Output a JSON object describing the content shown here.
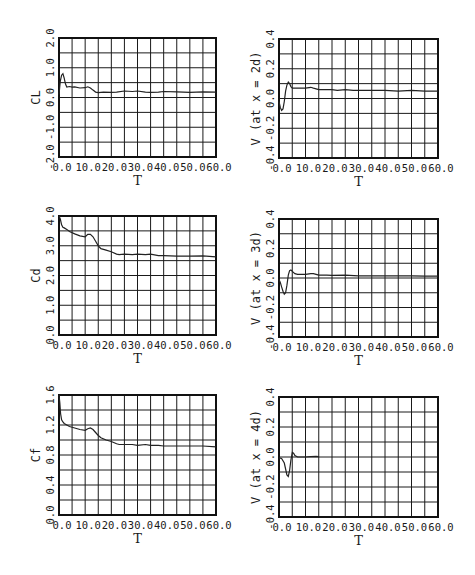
{
  "chart_data": [
    {
      "id": "cl",
      "type": "line",
      "title": "",
      "xlabel": "T",
      "ylabel": "CL",
      "xlim": [
        0,
        60
      ],
      "ylim": [
        -2.0,
        2.0
      ],
      "xticks": [
        "0.0",
        "10.0",
        "20.0",
        "30.0",
        "40.0",
        "50.0",
        "60.0"
      ],
      "yticks": [
        "-2.0",
        "-1.0",
        "0.0",
        "1.0",
        "2.0"
      ],
      "grid": true,
      "frame": {
        "left": 59,
        "top": 38,
        "right": 216,
        "bottom": 157
      },
      "x": [
        0,
        0.5,
        1,
        1.5,
        2,
        2.5,
        3,
        4,
        5,
        6,
        8,
        10,
        11,
        12,
        13,
        14,
        15,
        17,
        20,
        22,
        25,
        28,
        30,
        33,
        35,
        38,
        40,
        45,
        50,
        55,
        60
      ],
      "series": [
        {
          "name": "CL",
          "values": [
            0.1,
            0.55,
            0.75,
            0.8,
            0.65,
            0.45,
            0.35,
            0.37,
            0.35,
            0.36,
            0.32,
            0.33,
            0.36,
            0.32,
            0.25,
            0.18,
            0.16,
            0.18,
            0.17,
            0.18,
            0.22,
            0.2,
            0.22,
            0.18,
            0.17,
            0.18,
            0.2,
            0.19,
            0.17,
            0.19,
            0.18
          ]
        }
      ]
    },
    {
      "id": "v2d",
      "type": "line",
      "title": "",
      "xlabel": "T",
      "ylabel": "V (at x = 2d)",
      "xlim": [
        0,
        60
      ],
      "ylim": [
        -0.4,
        0.4
      ],
      "xticks": [
        "0.0",
        "10.0",
        "20.0",
        "30.0",
        "40.0",
        "50.0",
        "60.0"
      ],
      "yticks": [
        "-0.4",
        "-0.2",
        "0.0",
        "0.2",
        "0.4"
      ],
      "grid": true,
      "frame": {
        "left": 279,
        "top": 39,
        "right": 438,
        "bottom": 158
      },
      "x": [
        0,
        0.5,
        1,
        1.5,
        2,
        2.5,
        3,
        3.5,
        4,
        4.5,
        5,
        6,
        8,
        10,
        12,
        13,
        14,
        15,
        18,
        20,
        22,
        25,
        28,
        30,
        35,
        40,
        45,
        50,
        55,
        60
      ],
      "series": [
        {
          "name": "V",
          "values": [
            -0.02,
            -0.06,
            -0.08,
            -0.07,
            -0.02,
            0.05,
            0.09,
            0.11,
            0.1,
            0.08,
            0.07,
            0.07,
            0.07,
            0.07,
            0.075,
            0.07,
            0.065,
            0.06,
            0.06,
            0.06,
            0.055,
            0.06,
            0.055,
            0.055,
            0.055,
            0.055,
            0.05,
            0.055,
            0.05,
            0.05
          ]
        }
      ]
    },
    {
      "id": "cd",
      "type": "line",
      "title": "",
      "xlabel": "T",
      "ylabel": "Cd",
      "xlim": [
        0,
        60
      ],
      "ylim": [
        0.0,
        4.0
      ],
      "xticks": [
        "0.0",
        "10.0",
        "20.0",
        "30.0",
        "40.0",
        "50.0",
        "60.0"
      ],
      "yticks": [
        "0.0",
        "1.0",
        "2.0",
        "3.0",
        "4.0"
      ],
      "grid": true,
      "frame": {
        "left": 59,
        "top": 216,
        "right": 216,
        "bottom": 335
      },
      "x": [
        0,
        0.5,
        1,
        1.5,
        2,
        3,
        4,
        6,
        8,
        10,
        11,
        12,
        13,
        14,
        15,
        16,
        18,
        20,
        22,
        23,
        25,
        28,
        30,
        33,
        35,
        38,
        40,
        45,
        50,
        55,
        60
      ],
      "series": [
        {
          "name": "Cd",
          "values": [
            4.0,
            3.9,
            3.7,
            3.62,
            3.6,
            3.55,
            3.48,
            3.4,
            3.33,
            3.3,
            3.38,
            3.38,
            3.3,
            3.15,
            3.0,
            2.9,
            2.85,
            2.8,
            2.72,
            2.7,
            2.72,
            2.7,
            2.72,
            2.7,
            2.72,
            2.67,
            2.67,
            2.65,
            2.65,
            2.66,
            2.63
          ]
        }
      ]
    },
    {
      "id": "v3d",
      "type": "line",
      "title": "",
      "xlabel": "T",
      "ylabel": "V (at x = 3d)",
      "xlim": [
        0,
        60
      ],
      "ylim": [
        -0.4,
        0.4
      ],
      "xticks": [
        "0.0",
        "10.0",
        "20.0",
        "30.0",
        "40.0",
        "50.0",
        "60.0"
      ],
      "yticks": [
        "-0.4",
        "-0.2",
        "0.0",
        "0.2",
        "0.4"
      ],
      "grid": true,
      "frame": {
        "left": 279,
        "top": 219,
        "right": 438,
        "bottom": 337
      },
      "x": [
        0,
        0.5,
        1,
        1.5,
        2,
        2.5,
        3,
        3.5,
        4,
        4.5,
        5,
        6,
        7,
        8,
        10,
        12,
        13,
        14,
        15,
        18,
        20,
        25,
        30,
        35,
        40,
        45,
        50,
        55,
        60
      ],
      "series": [
        {
          "name": "V",
          "values": [
            -0.01,
            -0.03,
            -0.06,
            -0.09,
            -0.11,
            -0.1,
            -0.05,
            0.02,
            0.05,
            0.055,
            0.045,
            0.03,
            0.025,
            0.025,
            0.025,
            0.03,
            0.03,
            0.025,
            0.02,
            0.02,
            0.018,
            0.02,
            0.015,
            0.015,
            0.015,
            0.015,
            0.015,
            0.013,
            0.013
          ]
        }
      ]
    },
    {
      "id": "cf",
      "type": "line",
      "title": "",
      "xlabel": "T",
      "ylabel": "Cf",
      "xlim": [
        0,
        60
      ],
      "ylim": [
        0.0,
        1.6
      ],
      "xticks": [
        "0.0",
        "10.0",
        "20.0",
        "30.0",
        "40.0",
        "50.0",
        "60.0"
      ],
      "yticks": [
        "0.0",
        "0.4",
        "0.8",
        "1.2",
        "1.6"
      ],
      "grid": true,
      "frame": {
        "left": 59,
        "top": 395,
        "right": 216,
        "bottom": 515
      },
      "x": [
        0,
        0.3,
        0.6,
        1,
        1.5,
        2,
        3,
        4,
        6,
        8,
        10,
        11,
        12,
        13,
        14,
        15,
        16,
        18,
        20,
        22,
        23,
        25,
        28,
        30,
        33,
        35,
        38,
        40,
        45,
        50,
        55,
        60
      ],
      "series": [
        {
          "name": "Cf",
          "values": [
            1.6,
            1.5,
            1.35,
            1.27,
            1.24,
            1.22,
            1.2,
            1.18,
            1.16,
            1.14,
            1.13,
            1.15,
            1.16,
            1.14,
            1.1,
            1.06,
            1.03,
            1.0,
            0.98,
            0.95,
            0.94,
            0.94,
            0.94,
            0.93,
            0.94,
            0.93,
            0.93,
            0.92,
            0.92,
            0.92,
            0.92,
            0.91
          ]
        }
      ]
    },
    {
      "id": "v4d",
      "type": "line",
      "title": "",
      "xlabel": "T",
      "ylabel": "V (at x = 4d)",
      "xlim": [
        0,
        60
      ],
      "ylim": [
        -0.4,
        0.4
      ],
      "xticks": [
        "0.0",
        "10.0",
        "20.0",
        "30.0",
        "40.0",
        "50.0",
        "60.0"
      ],
      "yticks": [
        "-0.4",
        "-0.2",
        "0.0",
        "0.2",
        "0.4"
      ],
      "grid": true,
      "frame": {
        "left": 279,
        "top": 397,
        "right": 438,
        "bottom": 517
      },
      "x": [
        0,
        1,
        2,
        2.5,
        3,
        3.5,
        4,
        4.5,
        5,
        5.5,
        6,
        7,
        8,
        10,
        12,
        14,
        15
      ],
      "series": [
        {
          "name": "V",
          "values": [
            -0.005,
            -0.01,
            -0.04,
            -0.08,
            -0.12,
            -0.13,
            -0.09,
            -0.02,
            0.03,
            0.025,
            0.01,
            0.0,
            0.0,
            0.0,
            0.003,
            0.005,
            0.003
          ]
        }
      ]
    }
  ]
}
